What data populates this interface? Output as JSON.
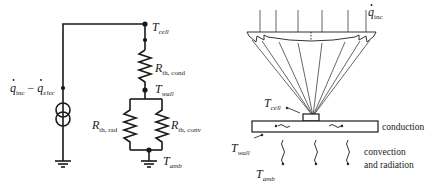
{
  "circuit": {
    "source_label": {
      "q1": "q",
      "q1_sub": "inc",
      "minus": " − ",
      "q2": "q",
      "q2_sub": "elec"
    },
    "node_top": {
      "T": "T",
      "sub": "cell"
    },
    "node_mid": {
      "T": "T",
      "sub": "wall"
    },
    "node_bottom": {
      "T": "T",
      "sub": "amb"
    },
    "r_cond": {
      "R": "R",
      "sub": "th, cond"
    },
    "r_rad": {
      "R": "R",
      "sub": "th, rad"
    },
    "r_conv": {
      "R": "R",
      "sub": "th, conv"
    }
  },
  "physical": {
    "incident": {
      "q": "q",
      "sub": "inc"
    },
    "cell": {
      "T": "T",
      "sub": "cell"
    },
    "wall": {
      "T": "T",
      "sub": "wall"
    },
    "amb": {
      "T": "T",
      "sub": "amb"
    },
    "conduction_label": "conduction",
    "convection_line1": "convection",
    "convection_line2": "and radiation"
  },
  "colors": {
    "stroke": "#1a1a1a",
    "rays": "#555555",
    "lens": "#333333"
  }
}
